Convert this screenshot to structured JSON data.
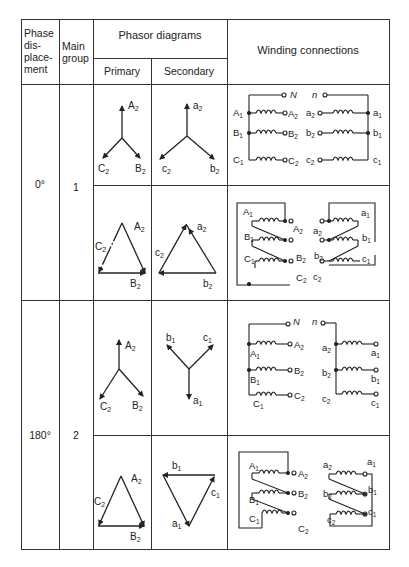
{
  "table": {
    "headers": {
      "phase_displacement": [
        "Phase",
        "dis-",
        "place-",
        "ment"
      ],
      "main_group": [
        "Main",
        "group"
      ],
      "phasor_diagrams": "Phasor diagrams",
      "primary": "Primary",
      "secondary": "Secondary",
      "winding_connections": "Winding connections"
    },
    "rows": [
      {
        "phase_displacement": "0°",
        "main_group": "1",
        "star": {
          "primary_labels": [
            "A2",
            "B2",
            "C2"
          ],
          "secondary_labels": [
            "a2",
            "b2",
            "c2"
          ],
          "winding_labels_primary": [
            "A1",
            "A2",
            "B1",
            "B2",
            "C1",
            "C2",
            "N"
          ],
          "winding_labels_secondary": [
            "a2",
            "a1",
            "b2",
            "b1",
            "c2",
            "c1",
            "n"
          ]
        },
        "delta": {
          "primary_labels": [
            "A2",
            "B2",
            "C2"
          ],
          "secondary_labels": [
            "a2",
            "b2",
            "c2"
          ],
          "winding_labels_primary": [
            "A1",
            "A2",
            "B1",
            "B2",
            "C1",
            "C2"
          ],
          "winding_labels_secondary": [
            "a2",
            "a1",
            "b2",
            "b1",
            "c2",
            "c1"
          ]
        }
      },
      {
        "phase_displacement": "180°",
        "main_group": "2",
        "star": {
          "primary_labels": [
            "A2",
            "B2",
            "C2"
          ],
          "secondary_labels": [
            "a1",
            "b1",
            "c1"
          ],
          "winding_labels_primary": [
            "A1",
            "A2",
            "B1",
            "B2",
            "C1",
            "C2",
            "N"
          ],
          "winding_labels_secondary": [
            "a2",
            "a1",
            "b2",
            "b1",
            "c2",
            "c1",
            "n"
          ]
        },
        "delta": {
          "primary_labels": [
            "A2",
            "B2",
            "C2"
          ],
          "secondary_labels": [
            "a1",
            "b1",
            "c1"
          ],
          "winding_labels_primary": [
            "A1",
            "A2",
            "B1",
            "B2",
            "C1",
            "C2"
          ],
          "winding_labels_secondary": [
            "a2",
            "a1",
            "b2",
            "b1",
            "c2",
            "c1"
          ]
        }
      }
    ]
  },
  "colors": {
    "line": "#333333",
    "background": "#ffffff"
  }
}
